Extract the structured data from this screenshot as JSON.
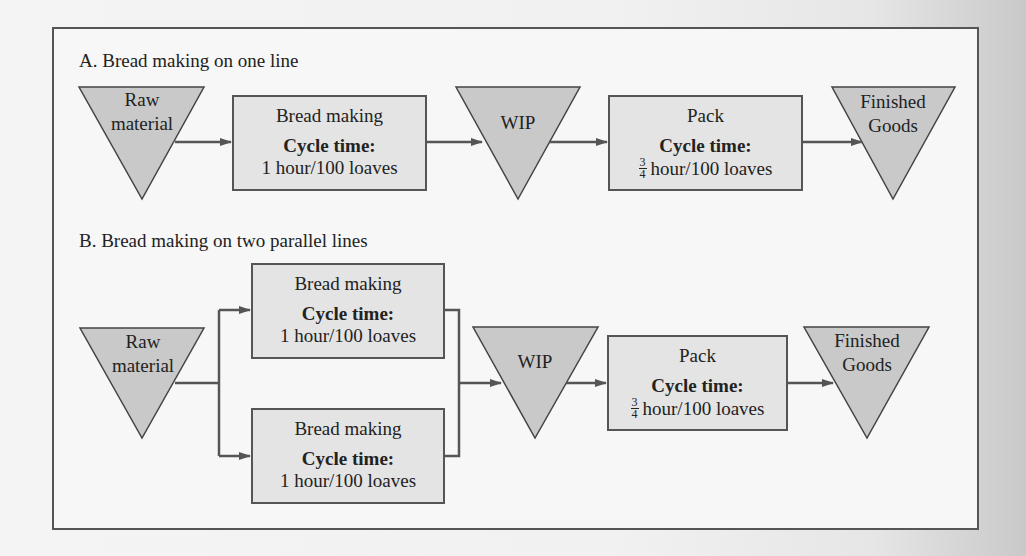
{
  "colors": {
    "triangle_fill": "#c9c9c9",
    "box_fill": "#e4e4e4",
    "stroke": "#555555",
    "frame_bg": "#f7f7f7"
  },
  "section_a": {
    "title": "A. Bread making on one line",
    "raw": {
      "line1": "Raw",
      "line2": "material"
    },
    "bread": {
      "name": "Bread making",
      "cycle_label": "Cycle time:",
      "cycle_value": "1 hour/100 loaves"
    },
    "wip": {
      "label": "WIP"
    },
    "pack": {
      "name": "Pack",
      "cycle_label": "Cycle time:",
      "frac_num": "3",
      "frac_den": "4",
      "cycle_value": "hour/100 loaves"
    },
    "finished": {
      "line1": "Finished",
      "line2": "Goods"
    }
  },
  "section_b": {
    "title": "B. Bread making on two parallel lines",
    "raw": {
      "line1": "Raw",
      "line2": "material"
    },
    "bread_lines": [
      {
        "name": "Bread making",
        "cycle_label": "Cycle time:",
        "cycle_value": "1 hour/100 loaves"
      },
      {
        "name": "Bread making",
        "cycle_label": "Cycle time:",
        "cycle_value": "1 hour/100 loaves"
      }
    ],
    "wip": {
      "label": "WIP"
    },
    "pack": {
      "name": "Pack",
      "cycle_label": "Cycle time:",
      "frac_num": "3",
      "frac_den": "4",
      "cycle_value": "hour/100 loaves"
    },
    "finished": {
      "line1": "Finished",
      "line2": "Goods"
    }
  }
}
